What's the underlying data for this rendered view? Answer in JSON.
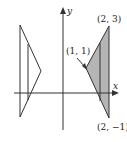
{
  "figure": {
    "axes": {
      "x_label": "x",
      "y_label": "y"
    },
    "points": [
      {
        "label": "(2, 3)"
      },
      {
        "label": "(1, 1)"
      },
      {
        "label": "(2, −1)"
      }
    ],
    "colors": {
      "shade": "#b5b5b5",
      "stroke": "#333333"
    }
  }
}
